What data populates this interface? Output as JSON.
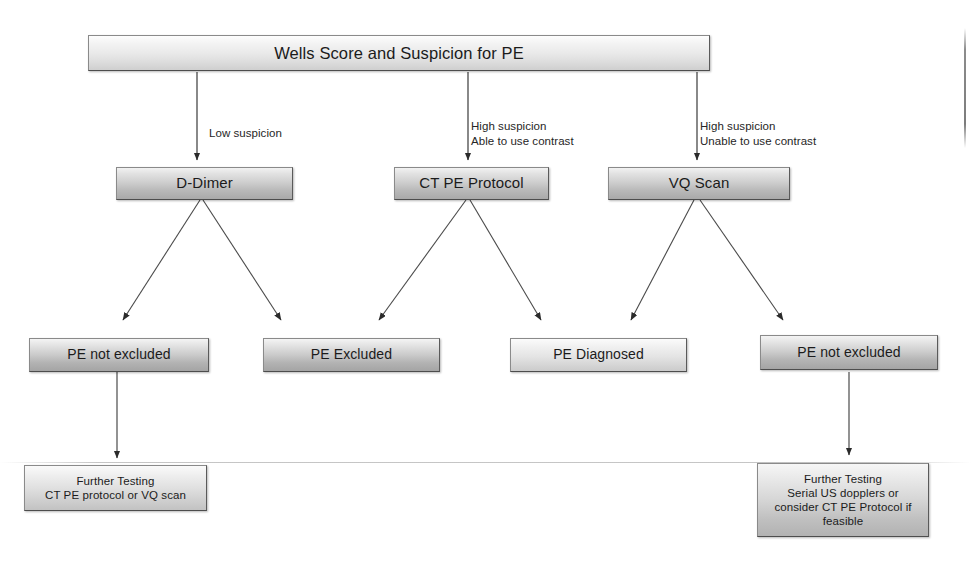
{
  "diagram": {
    "title_box": {
      "text": "Wells Score and Suspicion for PE"
    },
    "edge_labels": [
      {
        "id": "low-suspicion",
        "text": "Low suspicion"
      },
      {
        "id": "high-suspicion-contrast",
        "text": "High suspicion\nAble to use contrast"
      },
      {
        "id": "high-suspicion-no-contrast",
        "text": "High suspicion\nUnable to use contrast"
      }
    ],
    "tests": [
      {
        "id": "d-dimer",
        "text": "D-Dimer"
      },
      {
        "id": "ct-pe-protocol",
        "text": "CT PE Protocol"
      },
      {
        "id": "vq-scan",
        "text": "VQ Scan"
      }
    ],
    "results": [
      {
        "id": "pe-not-excluded-left",
        "text": "PE not excluded"
      },
      {
        "id": "pe-excluded",
        "text": "PE Excluded"
      },
      {
        "id": "pe-diagnosed",
        "text": "PE Diagnosed"
      },
      {
        "id": "pe-not-excluded-right",
        "text": "PE not excluded"
      }
    ],
    "terminals": [
      {
        "id": "further-testing-left",
        "text": "Further Testing\nCT PE protocol or VQ scan"
      },
      {
        "id": "further-testing-right",
        "text": "Further Testing\nSerial US dopplers or\nconsider CT PE Protocol if\nfeasible"
      }
    ],
    "colors": {
      "stroke": "#404040",
      "text": "#1b1b1b",
      "box_border": "#6f6f6f",
      "background": "#ffffff"
    }
  }
}
